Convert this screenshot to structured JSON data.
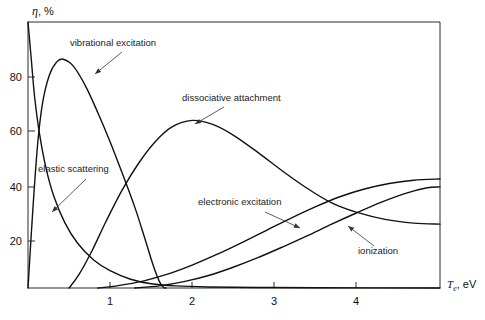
{
  "chart_data": {
    "type": "line",
    "title": "",
    "subtitle": "",
    "xlabel": "T_e, eV",
    "xlabel_main": "T",
    "xlabel_sub": "e",
    "xlabel_unit": ", eV",
    "ylabel": "η, %",
    "ylabel_symbol": "η",
    "ylabel_unit": ", %",
    "xlim": [
      0,
      5.02
    ],
    "ylim": [
      0,
      100
    ],
    "xticks": [
      1,
      2,
      3,
      4
    ],
    "xticklabels": [
      "1",
      "2",
      "3",
      "4"
    ],
    "yticks": [
      20,
      40,
      60,
      80
    ],
    "yticklabels": [
      "20",
      "40",
      "60",
      "80"
    ],
    "grid": false,
    "legend": "none",
    "frame": "box",
    "line_color": "#111111",
    "background": "#ffffff",
    "series": [
      {
        "name": "elastic scattering",
        "label": "elastic scattering",
        "points": [
          [
            0.0,
            100.0
          ],
          [
            0.04,
            86.0
          ],
          [
            0.08,
            72.0
          ],
          [
            0.14,
            58.0
          ],
          [
            0.22,
            45.0
          ],
          [
            0.32,
            34.0
          ],
          [
            0.45,
            24.5
          ],
          [
            0.6,
            17.0
          ],
          [
            0.8,
            10.5
          ],
          [
            1.0,
            6.5
          ],
          [
            1.25,
            3.3
          ],
          [
            1.5,
            1.6
          ],
          [
            1.8,
            0.8
          ],
          [
            2.2,
            0.4
          ],
          [
            2.8,
            0.2
          ],
          [
            3.5,
            0.1
          ],
          [
            5.02,
            0.0
          ]
        ]
      },
      {
        "name": "vibrational excitation",
        "label": "vibrational excitation",
        "points": [
          [
            0.0,
            0.0
          ],
          [
            0.06,
            30.0
          ],
          [
            0.12,
            55.0
          ],
          [
            0.18,
            70.0
          ],
          [
            0.26,
            80.0
          ],
          [
            0.35,
            85.0
          ],
          [
            0.43,
            86.0
          ],
          [
            0.55,
            83.5
          ],
          [
            0.7,
            76.0
          ],
          [
            0.85,
            66.0
          ],
          [
            1.0,
            55.0
          ],
          [
            1.15,
            43.0
          ],
          [
            1.3,
            30.5
          ],
          [
            1.42,
            19.0
          ],
          [
            1.52,
            9.0
          ],
          [
            1.6,
            2.5
          ],
          [
            1.65,
            0.3
          ],
          [
            1.68,
            0.0
          ]
        ]
      },
      {
        "name": "dissociative attachment",
        "label": "dissociative attachment",
        "points": [
          [
            0.5,
            0.0
          ],
          [
            0.62,
            5.0
          ],
          [
            0.78,
            14.0
          ],
          [
            0.95,
            25.0
          ],
          [
            1.15,
            37.0
          ],
          [
            1.35,
            47.0
          ],
          [
            1.55,
            55.0
          ],
          [
            1.75,
            60.5
          ],
          [
            2.0,
            63.0
          ],
          [
            2.25,
            61.5
          ],
          [
            2.5,
            57.5
          ],
          [
            2.8,
            51.0
          ],
          [
            3.1,
            44.0
          ],
          [
            3.4,
            37.5
          ],
          [
            3.7,
            32.0
          ],
          [
            4.0,
            28.5
          ],
          [
            4.35,
            25.8
          ],
          [
            4.7,
            24.4
          ],
          [
            5.02,
            24.0
          ]
        ]
      },
      {
        "name": "electronic excitation",
        "label": "electronic excitation",
        "points": [
          [
            0.85,
            0.0
          ],
          [
            1.1,
            0.9
          ],
          [
            1.4,
            2.6
          ],
          [
            1.7,
            5.2
          ],
          [
            2.0,
            8.6
          ],
          [
            2.3,
            12.6
          ],
          [
            2.6,
            17.0
          ],
          [
            2.9,
            21.6
          ],
          [
            3.2,
            26.2
          ],
          [
            3.5,
            30.5
          ],
          [
            3.8,
            34.3
          ],
          [
            4.1,
            37.2
          ],
          [
            4.4,
            39.3
          ],
          [
            4.7,
            40.5
          ],
          [
            5.02,
            41.0
          ]
        ]
      },
      {
        "name": "ionization",
        "label": "ionization",
        "points": [
          [
            1.3,
            0.0
          ],
          [
            1.6,
            0.8
          ],
          [
            1.9,
            2.4
          ],
          [
            2.2,
            4.7
          ],
          [
            2.5,
            7.8
          ],
          [
            2.8,
            11.4
          ],
          [
            3.1,
            15.4
          ],
          [
            3.4,
            19.6
          ],
          [
            3.7,
            24.0
          ],
          [
            4.0,
            28.2
          ],
          [
            4.3,
            32.2
          ],
          [
            4.6,
            35.6
          ],
          [
            4.85,
            37.6
          ],
          [
            5.02,
            38.0
          ]
        ]
      }
    ],
    "annotations": [
      {
        "name": "vibrational-excitation",
        "text": "vibrational excitation",
        "text_x": 70,
        "text_y": 46,
        "anchor": "start",
        "leader_from": [
          122,
          52
        ],
        "leader_to": [
          95,
          74
        ]
      },
      {
        "name": "dissociative-attachment",
        "text": "dissociative attachment",
        "text_x": 182,
        "text_y": 101,
        "anchor": "start",
        "leader_from": [
          224,
          107
        ],
        "leader_to": [
          195,
          124
        ]
      },
      {
        "name": "elastic-scattering",
        "text": "elastic scattering",
        "text_x": 38,
        "text_y": 172,
        "anchor": "start",
        "leader_from": [
          86,
          179
        ],
        "leader_to": [
          52,
          212
        ]
      },
      {
        "name": "electronic-excitation",
        "text": "electronic excitation",
        "text_x": 198,
        "text_y": 205,
        "anchor": "start",
        "leader_from": [
          265,
          212
        ],
        "leader_to": [
          300,
          228
        ]
      },
      {
        "name": "ionization",
        "text": "ionization",
        "text_x": 358,
        "text_y": 254,
        "anchor": "start",
        "leader_from": [
          374,
          246
        ],
        "leader_to": [
          348,
          226
        ]
      }
    ]
  },
  "axes": {
    "y_label_symbol": "η",
    "y_label_rest": ", %",
    "x_label_main": "T",
    "x_label_sub": "e",
    "x_label_rest": ", eV"
  }
}
